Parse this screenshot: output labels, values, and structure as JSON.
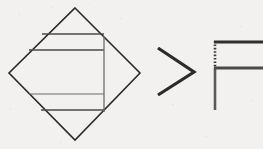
{
  "figure": {
    "background_color": "#f2f1ef",
    "width": 263,
    "height": 149,
    "ink_color": "#2b2b2b",
    "secondary_ink_color": "#5a5a5a"
  },
  "shapes": {
    "diamond": {
      "label": "diamond",
      "description": "Rotated square outline",
      "points": "75,8 140,73 75,140 9,73",
      "vertices": {
        "top": "75,8",
        "right": "140,73",
        "bottom": "75,140",
        "left": "9,73"
      },
      "stroke_color": "#2b2b2b"
    },
    "chords": [
      {
        "label": "chord-upper-1",
        "x1": 42,
        "y1": 34,
        "x2": 104,
        "y2": 34
      },
      {
        "label": "chord-upper-2",
        "x1": 29,
        "y1": 50,
        "x2": 104,
        "y2": 50
      },
      {
        "label": "chord-lower-1",
        "x1": 29,
        "y1": 94,
        "x2": 104,
        "y2": 94
      },
      {
        "label": "chord-lower-2",
        "x1": 41,
        "y1": 110,
        "x2": 104,
        "y2": 110
      }
    ],
    "vertical_divider": {
      "label": "vertical-divider",
      "x1": 104,
      "y1": 36,
      "x2": 104,
      "y2": 112,
      "stroke_color": "#6e6e6e"
    },
    "chevron": {
      "label": "greater-than-chevron",
      "glyph": ">",
      "points": "158,48 194,72 158,95",
      "stroke_color": "#2b2b2b"
    },
    "letter_f": {
      "label": "letter-f",
      "glyph": "F",
      "stem": {
        "x": 215,
        "y_top": 41,
        "y_bottom": 110,
        "dotted_y_top": 41,
        "dotted_y_bottom": 68,
        "dotted": true
      },
      "top_bar": {
        "x1": 214,
        "y1": 42,
        "x2": 263,
        "y2": 42
      },
      "mid_bar": {
        "x1": 214,
        "y1": 68,
        "x2": 263,
        "y2": 68
      }
    }
  },
  "annotations": {
    "figure_caption": "",
    "notes": ""
  }
}
